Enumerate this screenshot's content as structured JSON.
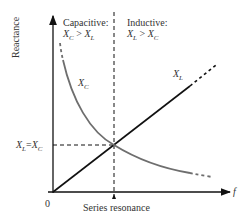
{
  "diagram": {
    "y_axis_label": "Reactance",
    "x_axis_label": "f",
    "origin_label": "0",
    "regions": {
      "capacitive": {
        "title": "Capacitive:",
        "relation": "X_C > X_L",
        "lhs": "X",
        "lhs_sub": "C",
        "op": ">",
        "rhs": "X",
        "rhs_sub": "L"
      },
      "inductive": {
        "title": "Inductive:",
        "relation": "X_L > X_C",
        "lhs": "X",
        "lhs_sub": "L",
        "op": ">",
        "rhs": "X",
        "rhs_sub": "C"
      }
    },
    "curves": {
      "xc": {
        "label": "X",
        "sub": "C",
        "color": "#6e6e6e",
        "shape": "hyperbola decreasing"
      },
      "xl": {
        "label": "X",
        "sub": "L",
        "color": "#111111",
        "shape": "line through origin increasing"
      }
    },
    "intersection_label": {
      "lhs": "X",
      "lhs_sub": "L",
      "eq": "=",
      "rhs": "X",
      "rhs_sub": "C"
    },
    "resonance_label": "Series resonance"
  }
}
